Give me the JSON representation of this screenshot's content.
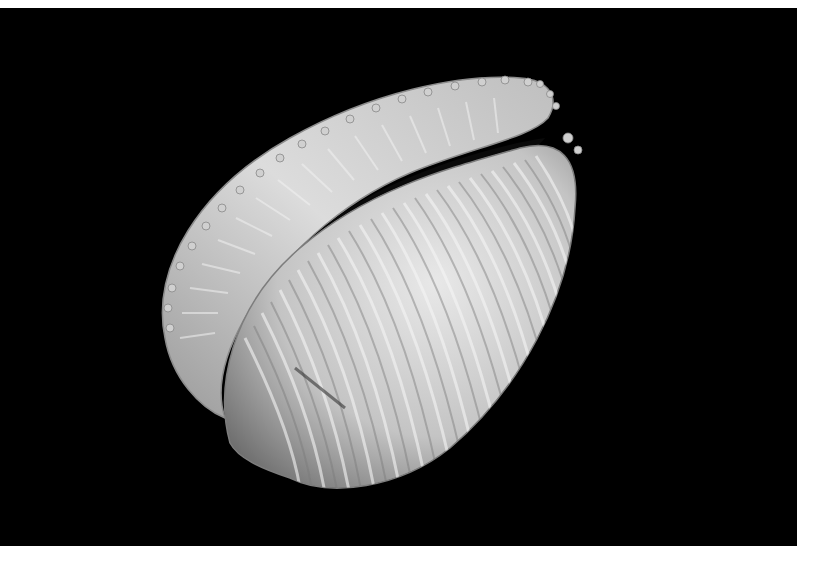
{
  "image": {
    "subject": "Ribbed white cowrie shell (Trivia) photographed on black background",
    "alt": "Close-up photograph of a white ribbed cowrie shell showing its toothed aperture",
    "colors": {
      "background": "#000000",
      "border": "#ffffff",
      "shell_light": "#e6e6e6",
      "shell_mid": "#bdbdbd",
      "shell_shadow": "#7a7a7a",
      "aperture": "#0a0a0a"
    }
  }
}
